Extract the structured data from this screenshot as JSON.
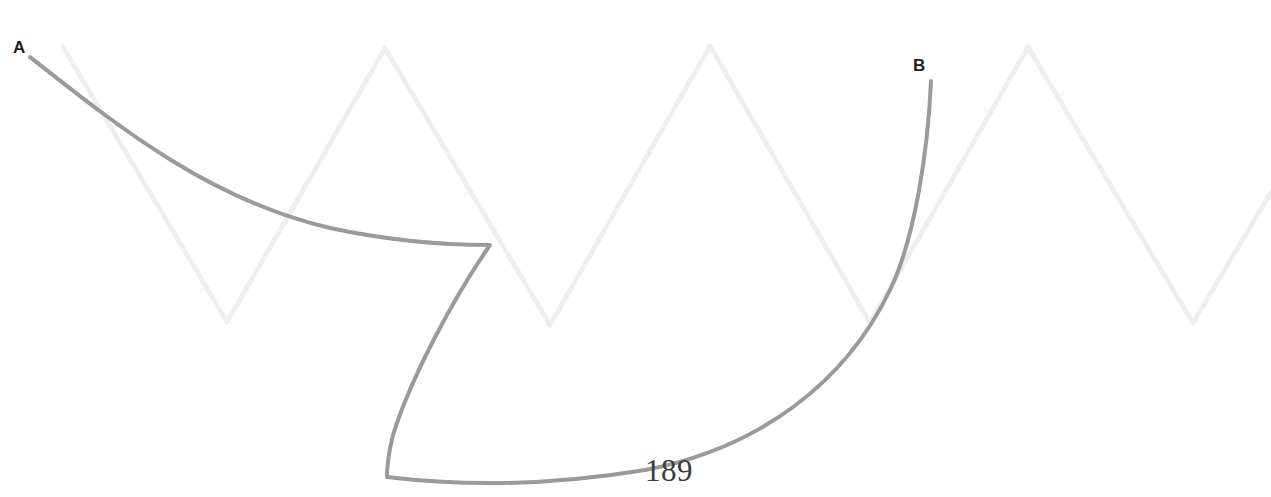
{
  "figure": {
    "number": "189",
    "caption_position": "bottom-center"
  },
  "labels": {
    "start_point": "A",
    "end_point": "B"
  },
  "colors": {
    "background": "#ffffff",
    "primary_curve": "#9a9a9a",
    "background_zigzag": "#eeeeee",
    "label_text": "#231f20",
    "figure_number_text": "#3b3b3b"
  },
  "geometry": {
    "canvas_width": 1271,
    "canvas_height": 497,
    "primary_curve": {
      "stroke_width": 4,
      "description": "cusped curve from A to B",
      "points": {
        "A": [
          30,
          57
        ],
        "cusp": [
          490,
          245
        ],
        "corner": [
          387,
          477
        ],
        "B": [
          931,
          81
        ]
      },
      "path": "M 30,57 C 120,128 210,200 330,228 C 400,243 455,245 490,245 C 452,300 410,380 393,435 C 388,455 387,468 387,477 C 470,487 560,484 645,470 C 760,448 846,382 890,290 C 915,238 928,150 931,81"
    },
    "background_zigzag": {
      "stroke_width": 5,
      "peak_y": 47,
      "valley_y": 323,
      "period": 323,
      "vertices": [
        [
          63,
          47
        ],
        [
          227,
          322
        ],
        [
          385,
          48
        ],
        [
          550,
          325
        ],
        [
          710,
          46
        ],
        [
          870,
          323
        ],
        [
          1028,
          47
        ],
        [
          1193,
          323
        ],
        [
          1271,
          192
        ]
      ]
    }
  }
}
